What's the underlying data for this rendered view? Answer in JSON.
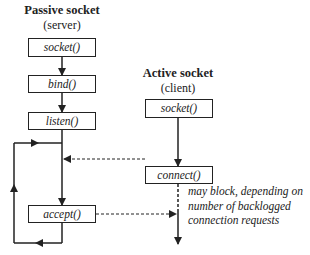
{
  "server": {
    "title": "Passive socket",
    "subtitle": "(server)",
    "steps": [
      "socket()",
      "bind()",
      "listen()",
      "accept()"
    ]
  },
  "client": {
    "title": "Active socket",
    "subtitle": "(client)",
    "steps": [
      "socket()",
      "connect()"
    ]
  },
  "annotation": {
    "lines": [
      "may block, depending on",
      "number of backlogged",
      "connection requests"
    ]
  },
  "colors": {
    "line": "#222222",
    "background": "#ffffff"
  }
}
